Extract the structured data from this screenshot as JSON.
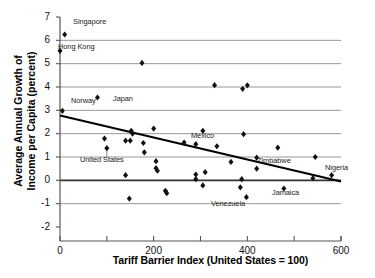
{
  "chart_data": {
    "type": "scatter",
    "title": "",
    "xlabel": "Tariff Barrier Index (United States = 100)",
    "ylabel_line1": "Average Annual Growth of",
    "ylabel_line2": "Income per Capita (percent)",
    "xlim": [
      0,
      600
    ],
    "ylim": [
      -2,
      7
    ],
    "xticks": [
      0,
      200,
      400,
      600
    ],
    "xtick_labels": [
      "0",
      "200",
      "400",
      "600"
    ],
    "xminorticks": [
      100,
      300,
      500
    ],
    "yticks": [
      -2,
      -1,
      0,
      1,
      2,
      3,
      4,
      5,
      6,
      7
    ],
    "ytick_labels": [
      "-2",
      "-1",
      "0",
      "1",
      "2",
      "3",
      "4",
      "5",
      "6",
      "7"
    ],
    "grid": true,
    "gridlines_y": [
      -1,
      0,
      1,
      2,
      3,
      4,
      5,
      6
    ],
    "legend": "none",
    "marker": "diamond",
    "marker_color": "#111111",
    "grid_color": "#8c8c8c",
    "zero_line_color": "#333333",
    "axis_color": "#555555",
    "trendline_color": "#000000",
    "points": [
      {
        "x": 10,
        "y": 6.25,
        "label": "Singapore"
      },
      {
        "x": 0,
        "y": 5.55,
        "label": "Hong Kong"
      },
      {
        "x": 175,
        "y": 5.03,
        "label": ""
      },
      {
        "x": 330,
        "y": 4.08,
        "label": ""
      },
      {
        "x": 390,
        "y": 3.92,
        "label": ""
      },
      {
        "x": 400,
        "y": 4.07,
        "label": ""
      },
      {
        "x": 80,
        "y": 3.55,
        "label": "Japan"
      },
      {
        "x": 5,
        "y": 2.98,
        "label": "Norway"
      },
      {
        "x": 200,
        "y": 2.22,
        "label": ""
      },
      {
        "x": 152,
        "y": 2.12,
        "label": ""
      },
      {
        "x": 155,
        "y": 2.0,
        "label": ""
      },
      {
        "x": 305,
        "y": 2.12,
        "label": ""
      },
      {
        "x": 392,
        "y": 1.98,
        "label": ""
      },
      {
        "x": 95,
        "y": 1.79,
        "label": ""
      },
      {
        "x": 140,
        "y": 1.7,
        "label": ""
      },
      {
        "x": 150,
        "y": 1.7,
        "label": ""
      },
      {
        "x": 178,
        "y": 1.6,
        "label": ""
      },
      {
        "x": 265,
        "y": 1.62,
        "label": ""
      },
      {
        "x": 290,
        "y": 1.55,
        "label": "Mexico"
      },
      {
        "x": 335,
        "y": 1.46,
        "label": ""
      },
      {
        "x": 465,
        "y": 1.4,
        "label": ""
      },
      {
        "x": 100,
        "y": 1.38,
        "label": "United States"
      },
      {
        "x": 180,
        "y": 1.2,
        "label": ""
      },
      {
        "x": 420,
        "y": 0.97,
        "label": ""
      },
      {
        "x": 545,
        "y": 1.0,
        "label": ""
      },
      {
        "x": 205,
        "y": 0.82,
        "label": ""
      },
      {
        "x": 365,
        "y": 0.79,
        "label": ""
      },
      {
        "x": 205,
        "y": 0.52,
        "label": ""
      },
      {
        "x": 208,
        "y": 0.41,
        "label": ""
      },
      {
        "x": 420,
        "y": 0.5,
        "label": ""
      },
      {
        "x": 310,
        "y": 0.35,
        "label": ""
      },
      {
        "x": 290,
        "y": 0.25,
        "label": ""
      },
      {
        "x": 140,
        "y": 0.22,
        "label": ""
      },
      {
        "x": 580,
        "y": 0.22,
        "label": "Nigeria"
      },
      {
        "x": 290,
        "y": 0.05,
        "label": ""
      },
      {
        "x": 388,
        "y": 0.05,
        "label": ""
      },
      {
        "x": 540,
        "y": 0.09,
        "label": ""
      },
      {
        "x": 305,
        "y": -0.22,
        "label": ""
      },
      {
        "x": 385,
        "y": -0.3,
        "label": ""
      },
      {
        "x": 478,
        "y": -0.35,
        "label": "Jamaica"
      },
      {
        "x": 225,
        "y": -0.45,
        "label": ""
      },
      {
        "x": 228,
        "y": -0.55,
        "label": ""
      },
      {
        "x": 398,
        "y": -0.72,
        "label": "Venezuela"
      },
      {
        "x": 148,
        "y": -0.78,
        "label": ""
      }
    ],
    "trendline": {
      "x0": 0,
      "y0": 2.78,
      "x1": 600,
      "y1": -0.05
    }
  },
  "annotations": [
    {
      "name": "singapore",
      "text": "Singapore",
      "left": 73,
      "top": 17
    },
    {
      "name": "hong-kong",
      "text": "Hong Kong",
      "left": 58,
      "top": 42
    },
    {
      "name": "japan",
      "text": "Japan",
      "left": 113,
      "top": 94
    },
    {
      "name": "norway",
      "text": "Norway",
      "left": 71,
      "top": 96
    },
    {
      "name": "mexico",
      "text": "Mexico",
      "left": 191,
      "top": 131
    },
    {
      "name": "united-states",
      "text": "United States",
      "left": 80,
      "top": 155
    },
    {
      "name": "zimbabwe",
      "text": "Zimbabwe",
      "left": 257,
      "top": 156
    },
    {
      "name": "nigeria",
      "text": "Nigeria",
      "left": 325,
      "top": 163
    },
    {
      "name": "jamaica",
      "text": "Jamaica",
      "left": 272,
      "top": 188
    },
    {
      "name": "venezuela",
      "text": "Venezuela",
      "left": 211,
      "top": 199
    }
  ]
}
